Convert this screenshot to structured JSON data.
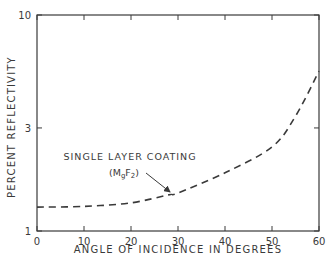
{
  "chart_data": {
    "type": "line",
    "title": "",
    "xlabel": "ANGLE OF INCIDENCE IN DEGREES",
    "ylabel": "PERCENT REFLECTIVITY",
    "xlim": [
      0,
      60
    ],
    "ylim": [
      1,
      10
    ],
    "yscale": "log",
    "grid": false,
    "x_ticks": [
      0,
      10,
      20,
      30,
      40,
      50,
      60
    ],
    "y_ticks": [
      1,
      3,
      10
    ],
    "series": [
      {
        "name": "Single layer coating (MgF2)",
        "style": "dashed",
        "x": [
          0,
          10,
          20,
          28,
          30,
          40,
          50,
          55,
          60
        ],
        "values": [
          1.29,
          1.3,
          1.35,
          1.47,
          1.5,
          1.86,
          2.45,
          3.4,
          5.5
        ]
      }
    ],
    "annotations": [
      {
        "text": "SINGLE LAYER COATING",
        "line2": "(MgF2)",
        "arrow_to": [
          28,
          1.47
        ]
      }
    ]
  },
  "labels": {
    "annotation_line1": "SINGLE LAYER COATING",
    "annotation_line2_open": "(M",
    "annotation_line2_sub1": "g",
    "annotation_line2_mid": "F",
    "annotation_line2_sub2": "2",
    "annotation_line2_close": ")"
  },
  "colors": {
    "ink": "#3a3a3a",
    "background": "#ffffff"
  }
}
